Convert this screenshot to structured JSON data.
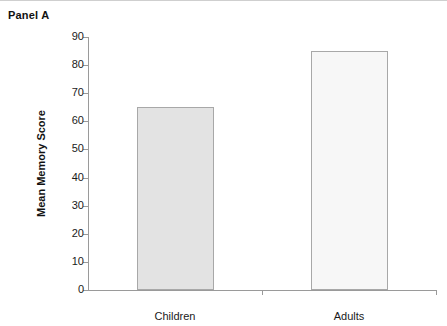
{
  "panel": {
    "title": "Panel A"
  },
  "chart_data": {
    "type": "bar",
    "title": "Panel A",
    "categories": [
      "Children",
      "Adults"
    ],
    "values": [
      65,
      85
    ],
    "series": [
      {
        "name": "Mean Memory Score",
        "values": [
          65,
          85
        ]
      }
    ],
    "xlabel": "",
    "ylabel": "Mean Memory Score",
    "ylim": [
      0,
      90
    ],
    "ytick_values": [
      0,
      10,
      20,
      30,
      40,
      50,
      60,
      70,
      80,
      90
    ],
    "ytick_labels": [
      "0",
      "10",
      "20",
      "30",
      "40",
      "50",
      "60",
      "70",
      "80",
      "90"
    ],
    "grid": false,
    "legend": false,
    "legend_position": "none",
    "bar_colors": [
      "#e3e3e3",
      "#f7f7f7"
    ],
    "bar_border_color": "#a8a8a8",
    "axis_color": "#9a9a9a"
  },
  "axis": {
    "y_title": "Mean Memory Score",
    "ticks": [
      {
        "label": "90",
        "value": 90
      },
      {
        "label": "80",
        "value": 80
      },
      {
        "label": "70",
        "value": 70
      },
      {
        "label": "60",
        "value": 60
      },
      {
        "label": "50",
        "value": 50
      },
      {
        "label": "40",
        "value": 40
      },
      {
        "label": "30",
        "value": 30
      },
      {
        "label": "20",
        "value": 20
      },
      {
        "label": "10",
        "value": 10
      },
      {
        "label": "0",
        "value": 0
      }
    ]
  },
  "bars": [
    {
      "label": "Children",
      "value": 65,
      "fill": "#e3e3e3"
    },
    {
      "label": "Adults",
      "value": 85,
      "fill": "#f7f7f7"
    }
  ]
}
